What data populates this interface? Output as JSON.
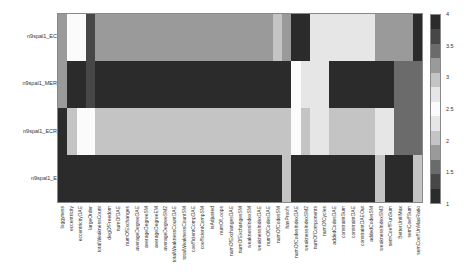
{
  "chart_data": {
    "type": "heatmap",
    "title": "",
    "xlabel": "",
    "ylabel": "",
    "rows": [
      "n9spal1_EC",
      "n9spal1_MER",
      "n9spal1_ECR",
      "n9spal1_E"
    ],
    "columns": [
      "loggyness",
      "eccentricity",
      "eccentricityDAE",
      "largeOrder",
      "totalWeaknessCount",
      "degOfFreedom",
      "numOfDAE",
      "numOfExchanges",
      "averageDegreeDAE",
      "averageDegreeSM",
      "averageDegreeEM",
      "averageDegreeSM2",
      "totalWeaknessCountDAE",
      "totalWeaknessCountSM",
      "coefficientCompDAE",
      "coefficientCompSM",
      "isAdjusted",
      "numOfLoops",
      "numOfExchangesDAE",
      "numOfExchangesSM",
      "weaknessIndexSM",
      "weaknessIndexDAE",
      "numOfCodesDAE",
      "numOfCodesSM",
      "hasProofs",
      "numOfCodesIndexDAE",
      "weaknessIndexSM2",
      "numOfComponents",
      "numOfCycles",
      "addedCodesDAE",
      "constraintSum",
      "constraintDAE",
      "constraintDAEOut",
      "addedCodesSM",
      "weaknessIndexSM3",
      "semCoeffFunSum",
      "BetterUntilMax",
      "semCoeffSum",
      "semCoeffUnMaxRatio"
    ],
    "values": [
      [
        3.1,
        2.5,
        2.5,
        3.6,
        3.2,
        3.2,
        3.2,
        3.2,
        3.2,
        3.2,
        3.2,
        3.2,
        3.2,
        3.2,
        3.2,
        3.2,
        3.2,
        3.2,
        3.2,
        3.2,
        3.2,
        3.2,
        3.2,
        2.9,
        3.1,
        3.8,
        3.8,
        2.8,
        2.8,
        2.8,
        2.8,
        2.8,
        2.8,
        2.8,
        3.1,
        3.1,
        3.1,
        3.1,
        4.0
      ],
      [
        3.1,
        4.0,
        4.0,
        3.6,
        4.0,
        4.0,
        4.0,
        4.0,
        4.0,
        4.0,
        4.0,
        4.0,
        4.0,
        4.0,
        4.0,
        4.0,
        4.0,
        4.0,
        4.0,
        4.0,
        4.0,
        4.0,
        4.0,
        4.0,
        4.0,
        2.5,
        2.8,
        2.8,
        2.8,
        3.8,
        3.8,
        3.8,
        3.8,
        3.8,
        3.8,
        3.8,
        3.5,
        3.5,
        3.5
      ],
      [
        4.0,
        3.0,
        2.5,
        2.5,
        2.9,
        2.9,
        2.9,
        2.9,
        2.9,
        2.9,
        2.9,
        2.9,
        2.9,
        2.9,
        2.9,
        2.9,
        2.9,
        2.9,
        2.9,
        2.9,
        2.9,
        2.9,
        2.9,
        2.9,
        2.9,
        2.5,
        3.0,
        2.8,
        2.8,
        3.0,
        3.0,
        3.0,
        3.0,
        3.0,
        2.7,
        2.7,
        3.5,
        3.5,
        3.5
      ],
      [
        3.9,
        3.9,
        3.9,
        3.9,
        3.9,
        3.9,
        3.9,
        3.9,
        3.9,
        3.9,
        3.9,
        3.9,
        3.9,
        3.9,
        3.9,
        3.9,
        3.9,
        3.9,
        3.9,
        3.9,
        3.9,
        3.9,
        3.9,
        3.9,
        2.9,
        4.0,
        4.0,
        4.0,
        4.0,
        4.0,
        4.0,
        4.0,
        4.0,
        4.0,
        2.9,
        4.0,
        4.0,
        4.0,
        3.0
      ]
    ],
    "colorbar": {
      "min": 1,
      "max": 4,
      "ticks": [
        "4",
        "3.5",
        "3",
        "2.5",
        "2",
        "1.5",
        "1"
      ]
    },
    "colorscale": [
      "#2b2b2b",
      "#474747",
      "#6b6b6b",
      "#9a9a9a",
      "#c4c4c4",
      "#e6e6e6",
      "#fbfbfb",
      "#e6e6e6",
      "#c4c4c4",
      "#9a9a9a",
      "#6b6b6b",
      "#474747",
      "#2b2b2b"
    ]
  }
}
